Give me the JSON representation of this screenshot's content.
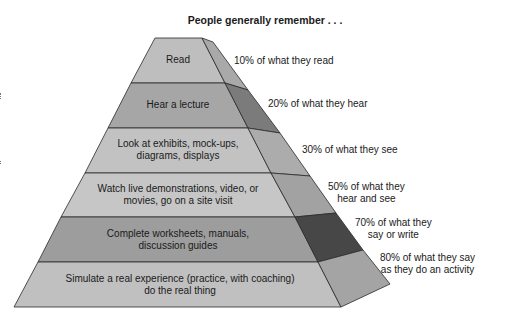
{
  "title": "People generally remember . . .",
  "colors": {
    "front_light": "#bdbdbd",
    "front_mid": "#a3a3a3",
    "side_light": "#a8a8a8",
    "side_mid": "#8a8a8a",
    "side_dark": "#4a4a4a",
    "edge": "#2a2a2a"
  },
  "levels": [
    {
      "activity": "Read",
      "retention": "10% of what they read"
    },
    {
      "activity": "Hear a lecture",
      "retention": "20% of what they hear"
    },
    {
      "activity": "Look at exhibits, mock-ups, diagrams, displays",
      "activity_lines": [
        "Look at exhibits, mock-ups,",
        "diagrams, displays"
      ],
      "retention": "30% of what they see"
    },
    {
      "activity": "Watch live demonstrations, video, or movies, go on a site visit",
      "activity_lines": [
        "Watch live demonstrations, video, or",
        "movies, go on a site visit"
      ],
      "retention": "50% of what they hear and see",
      "retention_lines": [
        "50% of what they",
        "hear and see"
      ]
    },
    {
      "activity": "Complete worksheets, manuals, discussion guides",
      "activity_lines": [
        "Complete worksheets, manuals,",
        "discussion guides"
      ],
      "retention": "70% of what they say or write",
      "retention_lines": [
        "70% of what they",
        "say or write"
      ]
    },
    {
      "activity": "Simulate a real experience (practice, with coaching) do the real thing",
      "activity_lines": [
        "Simulate a real experience (practice, with coaching)",
        "do the real thing"
      ],
      "retention": "80% of what they say as they do an activity",
      "retention_lines": [
        "80% of what they say",
        "as they do an activity"
      ]
    }
  ]
}
